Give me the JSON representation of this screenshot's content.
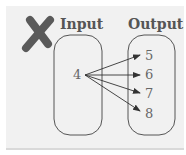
{
  "diagram": {
    "type": "mapping-diagram",
    "status_icon": "x-mark-icon",
    "status_color": "#5a5a5a",
    "input_label": "Input",
    "output_label": "Output",
    "inputs": [
      "4"
    ],
    "outputs": [
      "5",
      "6",
      "7",
      "8"
    ],
    "mappings": [
      {
        "from": "4",
        "to": "5"
      },
      {
        "from": "4",
        "to": "6"
      },
      {
        "from": "4",
        "to": "7"
      },
      {
        "from": "4",
        "to": "8"
      }
    ]
  }
}
